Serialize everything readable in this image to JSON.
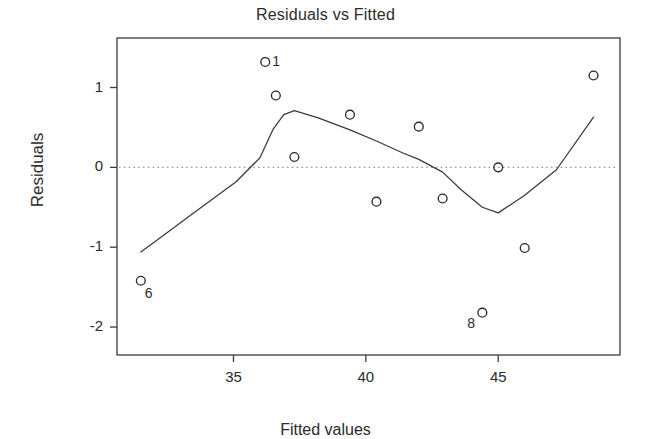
{
  "chart_data": {
    "type": "scatter",
    "title": "Residuals vs Fitted",
    "xlabel": "Fitted values",
    "ylabel": "Residuals",
    "xlim": [
      30.6,
      49.6
    ],
    "ylim": [
      -2.35,
      1.62
    ],
    "xticks": [
      35,
      40,
      45
    ],
    "xtick_labels": [
      "35",
      "40",
      "45"
    ],
    "yticks": [
      1,
      0,
      -1,
      -2
    ],
    "ytick_labels": [
      "1",
      "0",
      "-1",
      "-2"
    ],
    "grid": false,
    "legend": "none",
    "marker": "open-circle",
    "reference_line": {
      "y": 0,
      "style": "dotted",
      "color": "#9a9a9a"
    },
    "x": [
      31.5,
      36.2,
      36.6,
      37.3,
      39.4,
      40.4,
      42.0,
      42.9,
      44.4,
      45.0,
      46.0,
      48.6
    ],
    "y": [
      -1.42,
      1.32,
      0.9,
      0.13,
      0.66,
      -0.43,
      0.51,
      -0.39,
      -1.82,
      0.0,
      -1.01,
      1.15
    ],
    "point_labels": [
      {
        "index": 0,
        "text": "6",
        "x": 31.5,
        "y": -1.42,
        "position": "below-right"
      },
      {
        "index": 1,
        "text": "1",
        "x": 36.2,
        "y": 1.32,
        "position": "right"
      },
      {
        "index": 8,
        "text": "8",
        "x": 44.4,
        "y": -1.82,
        "position": "below-left"
      }
    ],
    "smooth_curve": {
      "name": "lowess",
      "color": "#3a3a3a",
      "x": [
        31.5,
        32.4,
        33.3,
        34.2,
        35.1,
        36.0,
        36.5,
        36.9,
        37.3,
        38.2,
        39.4,
        40.4,
        41.4,
        42.0,
        42.9,
        43.6,
        44.4,
        45.0,
        46.0,
        47.2,
        48.6
      ],
      "y": [
        -1.06,
        -0.84,
        -0.62,
        -0.4,
        -0.18,
        0.12,
        0.48,
        0.66,
        0.71,
        0.62,
        0.47,
        0.33,
        0.18,
        0.1,
        -0.06,
        -0.28,
        -0.5,
        -0.57,
        -0.35,
        -0.03,
        0.63
      ]
    }
  },
  "axes": {
    "frame_color": "#3a3a3a",
    "tick_color": "#3a3a3a"
  }
}
